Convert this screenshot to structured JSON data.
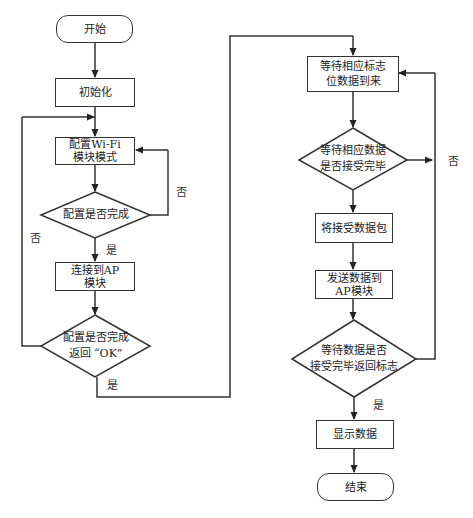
{
  "diagram": {
    "type": "flowchart",
    "nodes": {
      "start": "开始",
      "init": "初始化",
      "config_wifi": [
        "配置Wi-Fi",
        "模块模式"
      ],
      "check_config": "配置是否完成",
      "connect_ap": [
        "连接到AP",
        "模块"
      ],
      "check_ok": [
        "配置是否完成",
        "返回 “OK”"
      ],
      "wait_flag": [
        "等待相应标志",
        "位数据到来"
      ],
      "check_recv": [
        "等待相应数据",
        "是否接受完毕"
      ],
      "recv_packet": "将接受数据包",
      "send_ap": [
        "发送数据到",
        "AP模块"
      ],
      "check_return": [
        "等待数据是否",
        "接受完毕返回标志"
      ],
      "show": "显示数据",
      "end": "结束"
    },
    "labels": {
      "no": "否",
      "yes": "是"
    },
    "edges": [
      {
        "from": "start",
        "to": "init"
      },
      {
        "from": "init",
        "to": "config_wifi"
      },
      {
        "from": "config_wifi",
        "to": "check_config"
      },
      {
        "from": "check_config",
        "to": "config_wifi",
        "label": "否"
      },
      {
        "from": "check_config",
        "to": "connect_ap",
        "label": "是"
      },
      {
        "from": "connect_ap",
        "to": "check_ok"
      },
      {
        "from": "check_ok",
        "to": "config_wifi",
        "label": "否"
      },
      {
        "from": "check_ok",
        "to": "wait_flag",
        "label": "是"
      },
      {
        "from": "wait_flag",
        "to": "check_recv"
      },
      {
        "from": "check_recv",
        "to": "wait_flag",
        "label": "否"
      },
      {
        "from": "check_recv",
        "to": "recv_packet"
      },
      {
        "from": "recv_packet",
        "to": "send_ap"
      },
      {
        "from": "send_ap",
        "to": "check_return"
      },
      {
        "from": "check_return",
        "to": "wait_flag"
      },
      {
        "from": "check_return",
        "to": "show",
        "label": "是"
      },
      {
        "from": "show",
        "to": "end"
      }
    ]
  }
}
